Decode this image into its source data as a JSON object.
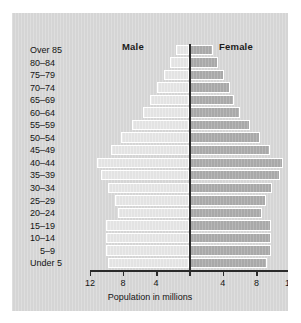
{
  "chart_data": {
    "type": "bar",
    "subtype": "population-pyramid",
    "title": "",
    "xlabel": "Population in millions",
    "ylabel": "",
    "categories": [
      "Over 85",
      "80–84",
      "75–79",
      "70–74",
      "65–69",
      "60–64",
      "55–59",
      "50–54",
      "45–49",
      "40–44",
      "35–39",
      "30–34",
      "25–29",
      "20–24",
      "15–19",
      "10–14",
      "5–9",
      "Under 5"
    ],
    "series": [
      {
        "name": "Male",
        "side": "left",
        "color": "#e3e3e3",
        "values": [
          1.6,
          2.3,
          3.1,
          3.9,
          4.7,
          5.6,
          6.9,
          8.2,
          9.4,
          11.1,
          10.7,
          9.8,
          9.0,
          8.6,
          10.1,
          10.1,
          10.1,
          9.8
        ]
      },
      {
        "name": "Female",
        "side": "right",
        "color": "#a9a9a9",
        "values": [
          2.8,
          3.4,
          4.1,
          4.8,
          5.3,
          6.1,
          7.2,
          8.4,
          9.6,
          11.2,
          10.8,
          9.9,
          9.1,
          8.7,
          9.7,
          9.7,
          9.7,
          9.3
        ]
      }
    ],
    "xlim": [
      -12,
      12
    ],
    "xticks": [
      12,
      8,
      4,
      0,
      4,
      8,
      12
    ],
    "xtick_labels": [
      "12",
      "8",
      "4",
      "",
      "4",
      "8",
      "12"
    ],
    "grid": false,
    "legend": "inline-top",
    "axis_color": "#2b2b2b",
    "background": "#d5d5d5"
  },
  "header": {
    "male_label": "Male",
    "female_label": "Female"
  },
  "axis": {
    "title": "Population in millions"
  }
}
